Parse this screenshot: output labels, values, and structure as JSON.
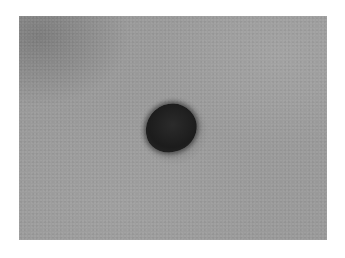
{
  "image": {
    "description": "Grayscale photograph of a single dark oval spot on a mottled gray background, with white border",
    "colors": {
      "border": "#ffffff",
      "background": "#9a9a9a",
      "spot": "#1c1c1c"
    }
  }
}
